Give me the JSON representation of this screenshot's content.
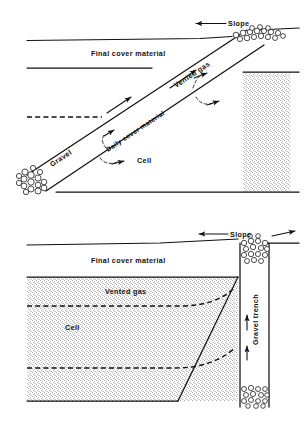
{
  "figure": {
    "background_color": "#ffffff",
    "line_color": "#111111",
    "stipple_color": "#b9b9b9"
  },
  "panels": [
    {
      "id": "top-panel",
      "name": "inclined-gravel-vent-trench",
      "labels": {
        "slope": "Slope",
        "final_cover_material": "Final cover material",
        "vented_gas": "Vented gas",
        "daily_cover_material": "Daily cover material",
        "cell": "Cell",
        "gravel": "Gravel"
      }
    },
    {
      "id": "bottom-panel",
      "name": "vertical-gravel-trench",
      "labels": {
        "slope": "Slope",
        "final_cover_material": "Final cover material",
        "vented_gas": "Vented gas",
        "cell": "Cell",
        "gravel_trench": "Gravel trench"
      }
    }
  ],
  "icons": {
    "slope_arrow_left": "arrow-left-icon",
    "slope_arrow_right": "arrow-right-icon",
    "gas_flow_arrow": "arrow-flow-icon",
    "gravel_pebbles": "gravel-pebble-icon"
  }
}
